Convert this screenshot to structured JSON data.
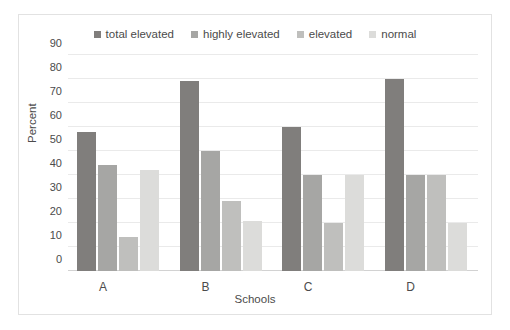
{
  "chart_data": {
    "type": "bar",
    "title": "",
    "xlabel": "Schools",
    "ylabel": "Percent",
    "categories": [
      "A",
      "B",
      "C",
      "D"
    ],
    "ylim": [
      0,
      90
    ],
    "yticks": [
      0,
      10,
      20,
      30,
      40,
      50,
      60,
      70,
      80,
      90
    ],
    "ytick_labels": [
      "0",
      "10",
      "20",
      "30",
      "40",
      "50",
      "60",
      "70",
      "80",
      "90"
    ],
    "grid": true,
    "legend_position": "top-center",
    "series": [
      {
        "name": "total elevated",
        "color": "#807E7C",
        "values": [
          58,
          79,
          60,
          80
        ]
      },
      {
        "name": "highly elevated",
        "color": "#A6A6A4",
        "values": [
          44,
          50,
          40,
          40
        ]
      },
      {
        "name": "elevated",
        "color": "#BFBFBD",
        "values": [
          14,
          29,
          20,
          40
        ]
      },
      {
        "name": "normal",
        "color": "#DCDCDA",
        "values": [
          42,
          21,
          40,
          20
        ]
      }
    ]
  }
}
